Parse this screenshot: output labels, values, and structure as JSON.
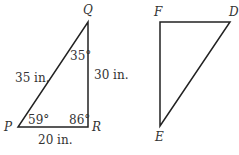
{
  "triangle_pqr": {
    "vertices": {
      "P": "P",
      "Q": "Q",
      "R": "R"
    },
    "sides": {
      "PQ": "35 in.",
      "QR": "30 in.",
      "PR": "20 in."
    },
    "angles": {
      "P": "59°",
      "Q": "35°",
      "R": "86°"
    }
  },
  "triangle_def": {
    "vertices": {
      "D": "D",
      "E": "E",
      "F": "F"
    }
  }
}
